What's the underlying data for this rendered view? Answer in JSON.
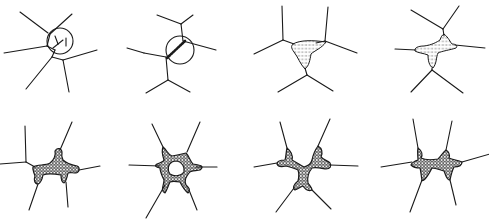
{
  "figure": {
    "background": "#ffffff",
    "ink": "#1a1a1a",
    "rows": 2,
    "columns": 4
  },
  "panels": [
    {
      "id": "panel-1",
      "edges": [
        [
          20,
          12,
          48,
          33
        ],
        [
          72,
          14,
          50,
          34
        ],
        [
          50,
          34,
          47,
          46
        ],
        [
          4,
          53,
          47,
          46
        ],
        [
          47,
          46,
          55,
          50
        ],
        [
          55,
          50,
          52,
          57
        ],
        [
          52,
          57,
          26,
          89
        ],
        [
          52,
          57,
          63,
          60
        ],
        [
          63,
          60,
          97,
          50
        ],
        [
          63,
          60,
          69,
          92
        ]
      ],
      "rings": [
        {
          "cx": 60,
          "cy": 41,
          "r": 13
        }
      ],
      "inner_strokes": [
        [
          55,
          36,
          58,
          44
        ],
        [
          58,
          44,
          53,
          48
        ],
        [
          58,
          44,
          63,
          40
        ],
        [
          66,
          38,
          66,
          46
        ]
      ],
      "blobs": []
    },
    {
      "id": "panel-2",
      "edges": [
        [
          157,
          15,
          181,
          24
        ],
        [
          193,
          15,
          181,
          24
        ],
        [
          181,
          24,
          183,
          41
        ],
        [
          183,
          41,
          216,
          50
        ],
        [
          127,
          48,
          144,
          53
        ],
        [
          144,
          53,
          166,
          57
        ],
        [
          166,
          57,
          168,
          80
        ],
        [
          168,
          80,
          146,
          93
        ],
        [
          168,
          80,
          190,
          92
        ]
      ],
      "rings": [
        {
          "cx": 180,
          "cy": 50,
          "r": 14
        }
      ],
      "hatch_lines": [
        [
          167,
          58,
          185,
          41
        ]
      ],
      "blobs": []
    },
    {
      "id": "panel-3",
      "edges": [
        [
          282,
          6,
          283,
          40
        ],
        [
          283,
          40,
          254,
          54
        ],
        [
          283,
          40,
          294,
          44
        ],
        [
          328,
          7,
          325,
          41
        ],
        [
          325,
          41,
          357,
          53
        ],
        [
          325,
          41,
          316,
          43
        ],
        [
          305,
          68,
          307,
          75
        ],
        [
          307,
          75,
          278,
          92
        ],
        [
          307,
          75,
          333,
          91
        ]
      ],
      "rings": [],
      "blobs": [
        {
          "style": "light",
          "d": "M293,44 C300,40 312,40 326,42 C322,48 314,51 311,54 C310,60 309,66 305,69 C300,64 298,57 294,52 C291,48 291,46 293,44 Z"
        }
      ]
    },
    {
      "id": "panel-4",
      "edges": [
        [
          411,
          10,
          443,
          29
        ],
        [
          459,
          6,
          443,
          29
        ],
        [
          443,
          29,
          444,
          36
        ],
        [
          395,
          49,
          416,
          50
        ],
        [
          455,
          45,
          485,
          48
        ],
        [
          432,
          68,
          432,
          70
        ],
        [
          432,
          70,
          411,
          92
        ],
        [
          432,
          70,
          463,
          93
        ]
      ],
      "rings": [],
      "blobs": [
        {
          "style": "light",
          "d": "M444,34 C449,38 450,42 452,44 C456,44 458,46 456,48 C450,50 442,51 438,53 C436,57 437,63 433,68 C429,66 428,60 428,55 C423,53 418,53 415,51 C414,48 418,46 424,46 C432,45 437,42 440,40 C441,37 442,35 444,34 Z"
        }
      ]
    },
    {
      "id": "panel-5",
      "edges": [
        [
          25,
          126,
          26,
          162
        ],
        [
          26,
          162,
          0,
          164
        ],
        [
          26,
          162,
          35,
          167
        ],
        [
          72,
          122,
          60,
          150
        ],
        [
          79,
          170,
          100,
          166
        ],
        [
          38,
          184,
          29,
          210
        ],
        [
          66,
          182,
          68,
          207
        ]
      ],
      "rings": [],
      "blobs": [
        {
          "style": "dense",
          "d": "M33,167 C38,164 45,166 50,163 C54,160 56,155 55,151 C57,147 62,148 62,153 C61,156 62,158 63,160 C66,163 72,165 77,166 C80,167 80,172 76,173 C72,173 70,172 68,173 C67,178 66,182 64,183 C61,182 61,178 61,175 C55,174 48,173 43,175 C42,180 41,183 38,184 C34,184 34,179 35,176 C34,172 32,170 33,167 Z"
        }
      ]
    },
    {
      "id": "panel-6",
      "edges": [
        [
          152,
          124,
          163,
          147
        ],
        [
          200,
          122,
          187,
          152
        ],
        [
          129,
          165,
          160,
          166
        ],
        [
          196,
          167,
          217,
          167
        ],
        [
          165,
          185,
          146,
          218
        ],
        [
          189,
          190,
          197,
          210
        ]
      ],
      "rings": [],
      "blobs": [
        {
          "style": "dense",
          "d": "M163,147 C167,150 168,155 172,156 C178,155 182,154 186,153 C189,156 190,161 193,164 C200,165 205,166 200,170 C196,171 190,170 189,173 C186,177 184,180 186,185 C189,188 191,190 188,193 C184,190 182,186 180,182 C175,181 172,181 170,182 C168,186 167,190 165,193 C160,191 164,185 164,180 C162,176 160,172 160,168 C156,167 154,166 157,164 C160,163 163,162 164,160 C163,156 161,152 163,147 Z M172,162 C168,164 167,170 170,174 C175,177 181,176 184,172 C185,167 182,162 177,161 C175,161 174,161 172,162 Z"
        }
      ]
    },
    {
      "id": "panel-7",
      "edges": [
        [
          280,
          122,
          287,
          148
        ],
        [
          330,
          119,
          318,
          146
        ],
        [
          254,
          167,
          277,
          163
        ],
        [
          330,
          165,
          358,
          166
        ],
        [
          294,
          188,
          276,
          212
        ],
        [
          312,
          190,
          331,
          209
        ]
      ],
      "rings": [],
      "blobs": [
        {
          "style": "dense",
          "d": "M287,148 C292,152 293,156 292,160 C296,162 300,165 304,167 C308,166 311,164 312,160 C313,155 315,150 318,146 C322,148 323,153 321,157 C324,160 328,161 330,163 C332,166 330,169 326,169 C320,168 316,167 312,168 C308,173 307,178 308,183 C310,186 312,188 312,190 C308,192 305,189 303,186 C300,187 298,189 295,190 C292,188 294,184 298,181 C299,177 299,173 298,170 C294,168 290,167 286,166 C282,167 278,167 277,164 C277,161 281,160 285,160 C286,157 286,152 287,148 Z"
        }
      ]
    },
    {
      "id": "panel-8",
      "edges": [
        [
          413,
          119,
          418,
          148
        ],
        [
          452,
          121,
          446,
          150
        ],
        [
          381,
          167,
          412,
          162
        ],
        [
          462,
          162,
          490,
          154
        ],
        [
          422,
          180,
          410,
          212
        ],
        [
          450,
          180,
          456,
          205
        ]
      ],
      "rings": [],
      "blobs": [
        {
          "style": "dense",
          "d": "M418,148 C422,151 423,155 421,158 C425,160 432,160 438,159 C441,156 443,152 446,150 C449,152 450,155 449,158 C453,160 458,160 462,162 C462,166 458,167 454,167 C452,171 451,175 450,180 C446,180 446,175 444,171 C440,170 436,168 432,168 C430,172 428,176 425,179 C423,181 421,181 422,180 C421,176 421,171 420,168 C416,168 413,167 411,165 C412,162 415,161 418,160 C418,156 417,152 418,148 Z"
        }
      ]
    }
  ]
}
